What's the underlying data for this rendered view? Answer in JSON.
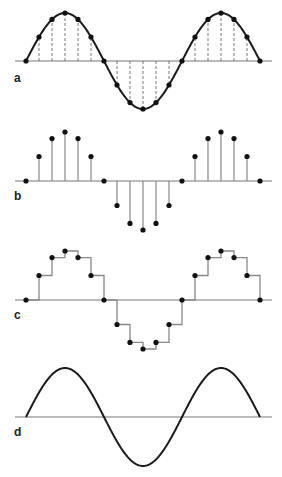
{
  "figure": {
    "panels": [
      {
        "id": "a",
        "label": "a",
        "description": "continuous sine wave with sampling points marked by dashed lines"
      },
      {
        "id": "b",
        "label": "b",
        "description": "discrete samples shown as stems with dots"
      },
      {
        "id": "c",
        "label": "c",
        "description": "sample-and-hold staircase reconstruction"
      },
      {
        "id": "d",
        "label": "d",
        "description": "reconstructed smooth sine wave"
      }
    ]
  },
  "geometry": {
    "x_start": 26,
    "step": 13,
    "samples": 19,
    "baseline_x0": 15,
    "baseline_x1": 272,
    "panels": {
      "a": {
        "center": 61,
        "amp": 48,
        "label_x": 14,
        "label_y": 82
      },
      "b": {
        "center": 181,
        "amp": 49,
        "label_x": 14,
        "label_y": 200
      },
      "c": {
        "center": 300,
        "amp": 49,
        "label_x": 14,
        "label_y": 319
      },
      "d": {
        "center": 417,
        "amp": 49,
        "label_x": 14,
        "label_y": 436
      }
    }
  },
  "colors": {
    "curve": "#1a1a1a",
    "dot": "#111111",
    "baseline": "#777777",
    "stem": "#888888",
    "dashed": "#555555"
  }
}
